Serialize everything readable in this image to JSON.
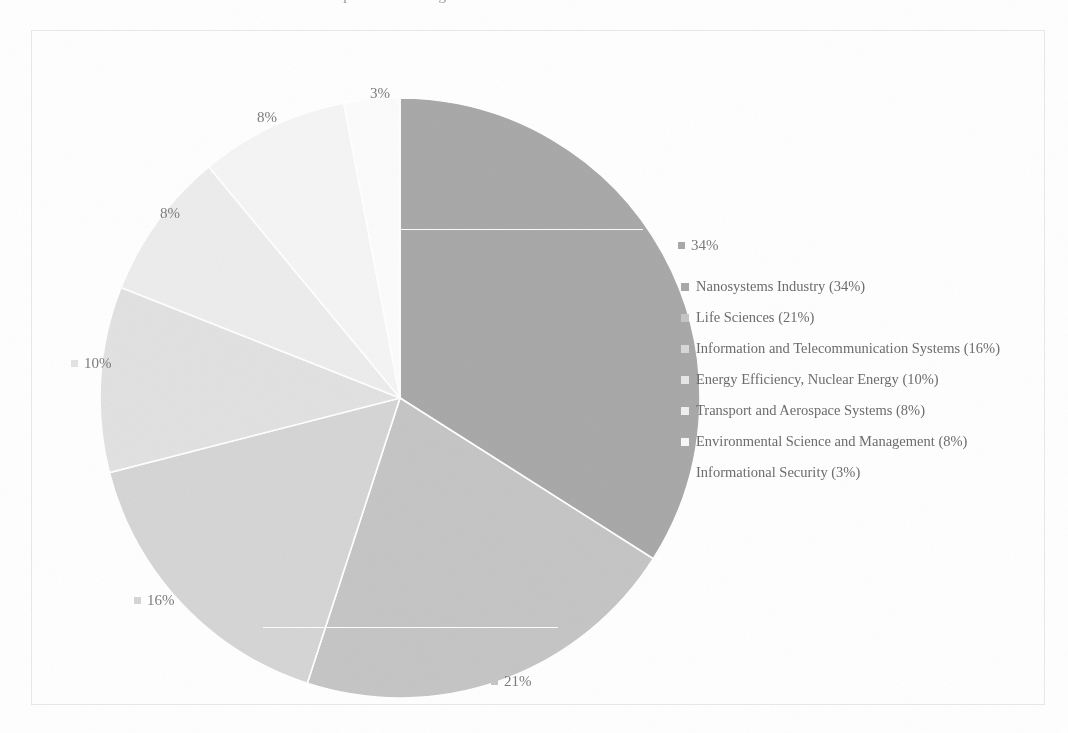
{
  "figure": {
    "top_cut_text": "presented in Figure 3 – structure of the areas of investment.",
    "border_color": "#e9e9ea",
    "background": "#ffffff"
  },
  "chart_data": {
    "type": "pie",
    "title": "",
    "subtitle": "",
    "xlabel": "",
    "ylabel": "",
    "grid": false,
    "legend_position": "right",
    "start_angle_deg": 0,
    "direction": "clockwise",
    "categories": [
      "Nanosystems Industry",
      "Life Sciences",
      "Information and Telecommunication Systems",
      "Energy Efficiency, Nuclear Energy",
      "Transport and Aerospace Systems",
      "Environmental Science and Management",
      "Informational Security"
    ],
    "values": [
      34,
      21,
      16,
      10,
      8,
      8,
      3
    ],
    "value_labels": [
      "34%",
      "21%",
      "16%",
      "10%",
      "8%",
      "8%",
      "3%"
    ],
    "colors": [
      "#a9a9a9",
      "#c6c6c6",
      "#d6d6d6",
      "#e2e2e2",
      "#ededed",
      "#f5f5f5",
      "#fcfcfc"
    ],
    "units": "percent"
  },
  "slice_labels": [
    {
      "text": "34%",
      "swatch": "#a9a9a9",
      "show_swatch": true,
      "left": 646,
      "top": 207
    },
    {
      "text": "21%",
      "swatch": "#c6c6c6",
      "show_swatch": true,
      "left": 459,
      "top": 643
    },
    {
      "text": "16%",
      "swatch": "#d6d6d6",
      "show_swatch": true,
      "left": 102,
      "top": 562
    },
    {
      "text": "10%",
      "swatch": "#e4e4e4",
      "show_swatch": true,
      "left": 39,
      "top": 325
    },
    {
      "text": "8%",
      "swatch": "#efefef",
      "show_swatch": false,
      "left": 115,
      "top": 175
    },
    {
      "text": "8%",
      "swatch": "#f7f7f7",
      "show_swatch": false,
      "left": 212,
      "top": 79
    },
    {
      "text": "3%",
      "swatch": "#fcfcfc",
      "show_swatch": false,
      "left": 325,
      "top": 55
    }
  ],
  "legend": {
    "items": [
      {
        "label": "Nanosystems Industry (34%)",
        "swatch": "#a9a9a9",
        "show_swatch": true
      },
      {
        "label": "Life Sciences (21%)",
        "swatch": "#c6c6c6",
        "show_swatch": true
      },
      {
        "label": "Information and Telecommunication Systems (16%)",
        "swatch": "#d8d8d8",
        "show_swatch": true
      },
      {
        "label": "Energy Efficiency, Nuclear Energy (10%)",
        "swatch": "#e6e6e6",
        "show_swatch": true
      },
      {
        "label": "Transport and Aerospace Systems (8%)",
        "swatch": "#f0f0f0",
        "show_swatch": true
      },
      {
        "label": "Environmental Science and Management (8%)",
        "swatch": "#f8f8f8",
        "show_swatch": true
      },
      {
        "label": "Informational Security (3%)",
        "swatch": "#fdfdfd",
        "show_swatch": false
      }
    ]
  }
}
